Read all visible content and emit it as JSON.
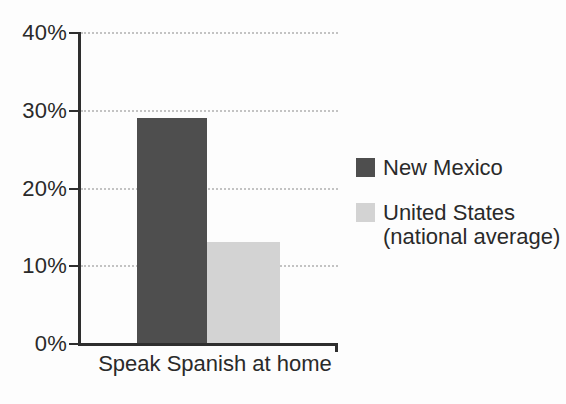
{
  "chart_data": {
    "type": "bar",
    "categories": [
      "Speak Spanish at home"
    ],
    "series": [
      {
        "name": "New Mexico",
        "values": [
          29
        ],
        "color": "#4e4e4e"
      },
      {
        "name": "United States (national average)",
        "values": [
          13
        ],
        "color": "#d3d3d3"
      }
    ],
    "ylim": [
      0,
      40
    ],
    "ytick_step": 10,
    "ytick_labels": [
      "0%",
      "10%",
      "20%",
      "30%",
      "40%"
    ],
    "grid": "horizontal-dotted",
    "legend_position": "right"
  },
  "axis": {
    "y_tick_labels": [
      "40%",
      "30%",
      "20%",
      "10%",
      "0%"
    ],
    "x_category_label": "Speak Spanish at home"
  },
  "legend": {
    "items": [
      {
        "label": "New Mexico"
      },
      {
        "line1": "United States",
        "line2": "(national average)"
      }
    ]
  },
  "colors": {
    "new_mexico_bar": "#4e4e4e",
    "united_states_bar": "#d3d3d3",
    "axis": "#2e2e2e",
    "gridline": "#c3c3c3",
    "text": "#2a2a2a",
    "background": "#fdfdfd"
  }
}
